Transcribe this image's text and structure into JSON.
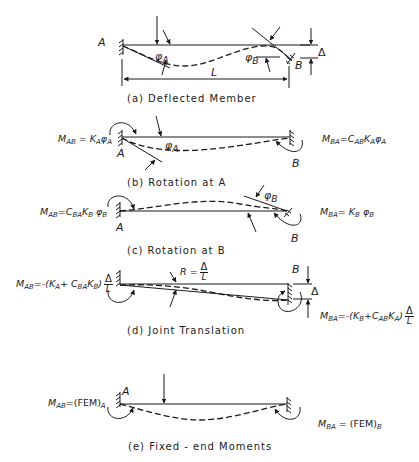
{
  "figure": {
    "panels": [
      {
        "id": "a",
        "caption": "(a) Deflected Member",
        "labels": {
          "end_a": "A",
          "end_b": "B",
          "phi_a": "φA",
          "phi_b": "φB",
          "length": "L",
          "delta": "Δ"
        }
      },
      {
        "id": "b",
        "caption": "(b) Rotation at A",
        "labels": {
          "end_a": "A",
          "end_b": "B",
          "phi_a": "φA"
        },
        "equations": {
          "left": "M_AB = K_A φ_A",
          "right": "M_BA = C_AB K_A φ_A"
        }
      },
      {
        "id": "c",
        "caption": "(c) Rotation at B",
        "labels": {
          "end_a": "A",
          "end_b": "B",
          "phi_b": "φB"
        },
        "equations": {
          "left": "M_AB = C_BA K_B φ_B",
          "right": "M_BA = K_B φ_B"
        }
      },
      {
        "id": "d",
        "caption": "(d) Joint Translation",
        "labels": {
          "end_b": "B",
          "rotation": "R = Δ/L",
          "delta": "Δ"
        },
        "equations": {
          "left": "M_AB = -(K_A + C_BA K_B) Δ/L",
          "right": "M_BA = -(K_B + C_AB K_A) Δ/L"
        }
      },
      {
        "id": "e",
        "caption": "(e) Fixed-end Moments",
        "labels": {
          "end_a": "A"
        },
        "equations": {
          "left": "M_AB = (FEM)_A",
          "right": "M_BA = (FEM)_B"
        }
      }
    ],
    "text": {
      "A": "A",
      "B": "B",
      "L": "L",
      "Delta": "Δ",
      "phi": "φ",
      "R": "R",
      "eq": "=",
      "M": "M",
      "K": "K",
      "C": "C",
      "FEM": "(FEM)",
      "sub_AB": "AB",
      "sub_BA": "BA",
      "sub_A": "A",
      "sub_B": "B",
      "cap_a": "(a)  Deflected  Member",
      "cap_b": "(b)  Rotation  at  A",
      "cap_c": "(c)  Rotation  at  B",
      "cap_d": "(d)  Joint  Translation",
      "cap_e": "(e)  Fixed - end  Moments",
      "minus_open": "-(",
      "plus": "+",
      "close": ")"
    }
  }
}
